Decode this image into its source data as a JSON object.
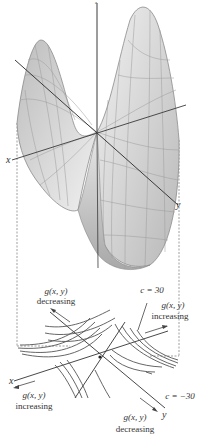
{
  "figure": {
    "surface": {
      "z_axis_label": "z",
      "x_axis_label": "x",
      "y_axis_label": "y"
    },
    "contour": {
      "x_axis_label": "x",
      "y_axis_label": "y",
      "annotations": {
        "top_left_fn": "g(x, y)",
        "top_left_dir": "decreasing",
        "top_right_level": "c = 30",
        "right_fn": "g(x, y)",
        "right_dir": "increasing",
        "bottom_left_fn": "g(x, y)",
        "bottom_left_dir": "increasing",
        "bottom_right_level": "c = −30",
        "bottom_fn": "g(x, y)",
        "bottom_dir": "decreasing"
      }
    },
    "colors": {
      "surface_fill": "#d8d8d8",
      "surface_edge": "#8a8a8a",
      "axis": "#3a3a3a",
      "contour": "#555555",
      "dashed": "#777777"
    }
  }
}
